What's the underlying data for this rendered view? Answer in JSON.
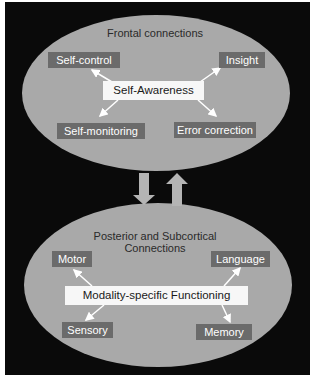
{
  "colors": {
    "background": "#0a0a0a",
    "ellipse_fill": "#a9a9a9",
    "label_fill": "#6b6b6b",
    "center_fill": "#f7f7f7",
    "arrow": "#ffffff",
    "vertical_arrow": "#b4b4b4"
  },
  "top_region": {
    "title": "Frontal connections",
    "center": "Self-Awareness",
    "nodes": {
      "top_left": "Self-control",
      "top_right": "Insight",
      "bottom_left": "Self-monitoring",
      "bottom_right": "Error correction"
    }
  },
  "bottom_region": {
    "title_line1": "Posterior and Subcortical",
    "title_line2": "Connections",
    "center": "Modality-specific Functioning",
    "nodes": {
      "top_left": "Motor",
      "top_right": "Language",
      "bottom_left": "Sensory",
      "bottom_right": "Memory"
    }
  },
  "connector_arrows": [
    "down",
    "up"
  ]
}
